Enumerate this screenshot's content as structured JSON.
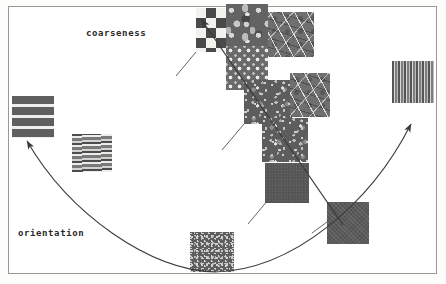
{
  "figure": {
    "background_color": "#ffffff",
    "border_color": "#9a9a97",
    "width": 446,
    "height": 284
  },
  "axes": [
    {
      "id": "coarseness",
      "label": "coarseness",
      "label_x": 86,
      "label_y": 28,
      "kind": "straight-arrow",
      "direction": "up-left",
      "color": "#3a3a3a",
      "start": {
        "x": 343,
        "y": 225
      },
      "end": {
        "x": 197,
        "y": 15
      }
    },
    {
      "id": "orientation",
      "label": "orientation",
      "label_x": 18,
      "label_y": 228,
      "kind": "curved-arrow",
      "direction": "two-ended-arc",
      "color": "#3a3a3a",
      "left_end": {
        "x": 23,
        "y": 134
      },
      "right_end": {
        "x": 414,
        "y": 117
      },
      "bottom": {
        "x": 215,
        "y": 272
      }
    }
  ],
  "patches": [
    {
      "name": "checkerboard",
      "texture": "tex-checker",
      "x": 196,
      "y": 8,
      "w": 44,
      "h": 44
    },
    {
      "name": "dark-granite-top",
      "texture": "tex-granite",
      "x": 226,
      "y": 4,
      "w": 42,
      "h": 42
    },
    {
      "name": "branch-filaments",
      "texture": "tex-branch",
      "x": 268,
      "y": 12,
      "w": 46,
      "h": 45
    },
    {
      "name": "dotted-mesh",
      "texture": "tex-dots",
      "x": 226,
      "y": 46,
      "w": 42,
      "h": 44
    },
    {
      "name": "mottled-noise-mid",
      "texture": "tex-noise-dark",
      "x": 244,
      "y": 80,
      "w": 48,
      "h": 44
    },
    {
      "name": "branch-filaments-2",
      "texture": "tex-branch",
      "x": 290,
      "y": 73,
      "w": 40,
      "h": 44
    },
    {
      "name": "mottled-noise-low",
      "texture": "tex-noise-dark",
      "x": 262,
      "y": 118,
      "w": 46,
      "h": 44
    },
    {
      "name": "flat-dark-center",
      "texture": "tex-flat",
      "x": 265,
      "y": 163,
      "w": 44,
      "h": 40
    },
    {
      "name": "dither-block",
      "texture": "tex-dither",
      "x": 327,
      "y": 202,
      "w": 42,
      "h": 42
    },
    {
      "name": "fine-speckle-bottom",
      "texture": "tex-speckle",
      "x": 190,
      "y": 232,
      "w": 44,
      "h": 40
    },
    {
      "name": "horizontal-bands",
      "texture": "tex-hbands",
      "x": 12,
      "y": 96,
      "w": 42,
      "h": 42
    },
    {
      "name": "wood-grain",
      "texture": "tex-grain",
      "x": 72,
      "y": 134,
      "w": 40,
      "h": 38
    },
    {
      "name": "vertical-stripes",
      "texture": "tex-vstripes",
      "x": 392,
      "y": 61,
      "w": 42,
      "h": 42
    }
  ],
  "connectors": [
    {
      "name": "checker-to-axis",
      "x1": 196,
      "y1": 52,
      "x2": 176,
      "y2": 76
    },
    {
      "name": "noise-to-axis",
      "x1": 244,
      "y1": 124,
      "x2": 222,
      "y2": 150
    },
    {
      "name": "flat-to-axis",
      "x1": 268,
      "y1": 200,
      "x2": 248,
      "y2": 224
    },
    {
      "name": "dither-to-axis",
      "x1": 327,
      "y1": 222,
      "x2": 312,
      "y2": 233
    }
  ]
}
